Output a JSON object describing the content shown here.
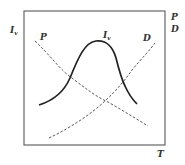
{
  "diagram": {
    "frame": {
      "x": 24,
      "y": 11,
      "width": 141,
      "height": 134,
      "stroke": "#555555"
    },
    "axis_labels": {
      "left": {
        "main": "I",
        "sub": "v"
      },
      "right_top": "P",
      "right_bottom": "D",
      "bottom": "T"
    },
    "curves": [
      {
        "name": "P",
        "style": "dashed",
        "label": "P"
      },
      {
        "name": "D",
        "style": "dashed",
        "label": "D"
      },
      {
        "name": "Iv",
        "style": "solid",
        "label_main": "I",
        "label_sub": "v"
      }
    ],
    "colors": {
      "line": "#333333",
      "frame": "#555555"
    }
  }
}
